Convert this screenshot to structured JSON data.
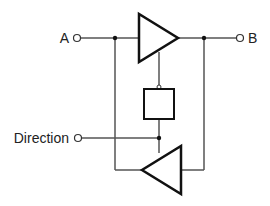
{
  "diagram": {
    "type": "bidirectional buffer",
    "labels": {
      "port_a": "A",
      "port_b": "B",
      "direction": "Direction"
    },
    "colors": {
      "wire": "#555555",
      "symbol": "#111111",
      "background": "#ffffff"
    }
  }
}
